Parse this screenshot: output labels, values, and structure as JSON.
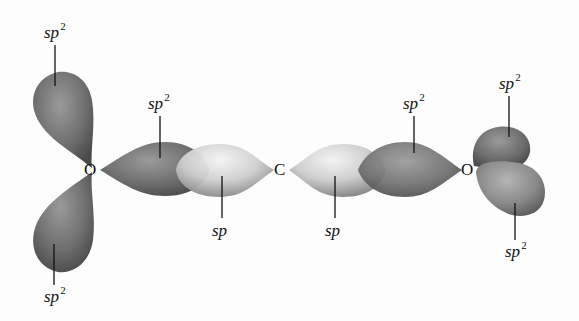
{
  "diagram": {
    "title": "",
    "atoms": [
      {
        "id": "O-left",
        "symbol": "O"
      },
      {
        "id": "C-center",
        "symbol": "C"
      },
      {
        "id": "O-right",
        "symbol": "O"
      }
    ],
    "labels": {
      "o_left_upper": {
        "base": "sp",
        "sup": "2"
      },
      "o_left_lower": {
        "base": "sp",
        "sup": "2"
      },
      "o_left_bond": {
        "base": "sp",
        "sup": "2"
      },
      "c_left_bond": {
        "base": "sp",
        "sup": ""
      },
      "c_right_bond": {
        "base": "sp",
        "sup": ""
      },
      "o_right_bond": {
        "base": "sp",
        "sup": "2"
      },
      "o_right_upper": {
        "base": "sp",
        "sup": "2"
      },
      "o_right_lower": {
        "base": "sp",
        "sup": "2"
      }
    },
    "colors": {
      "sp2_lobe": "#6e6e6e",
      "sp_lobe": "#d8d8d8",
      "background": "#fdfdfd"
    }
  }
}
